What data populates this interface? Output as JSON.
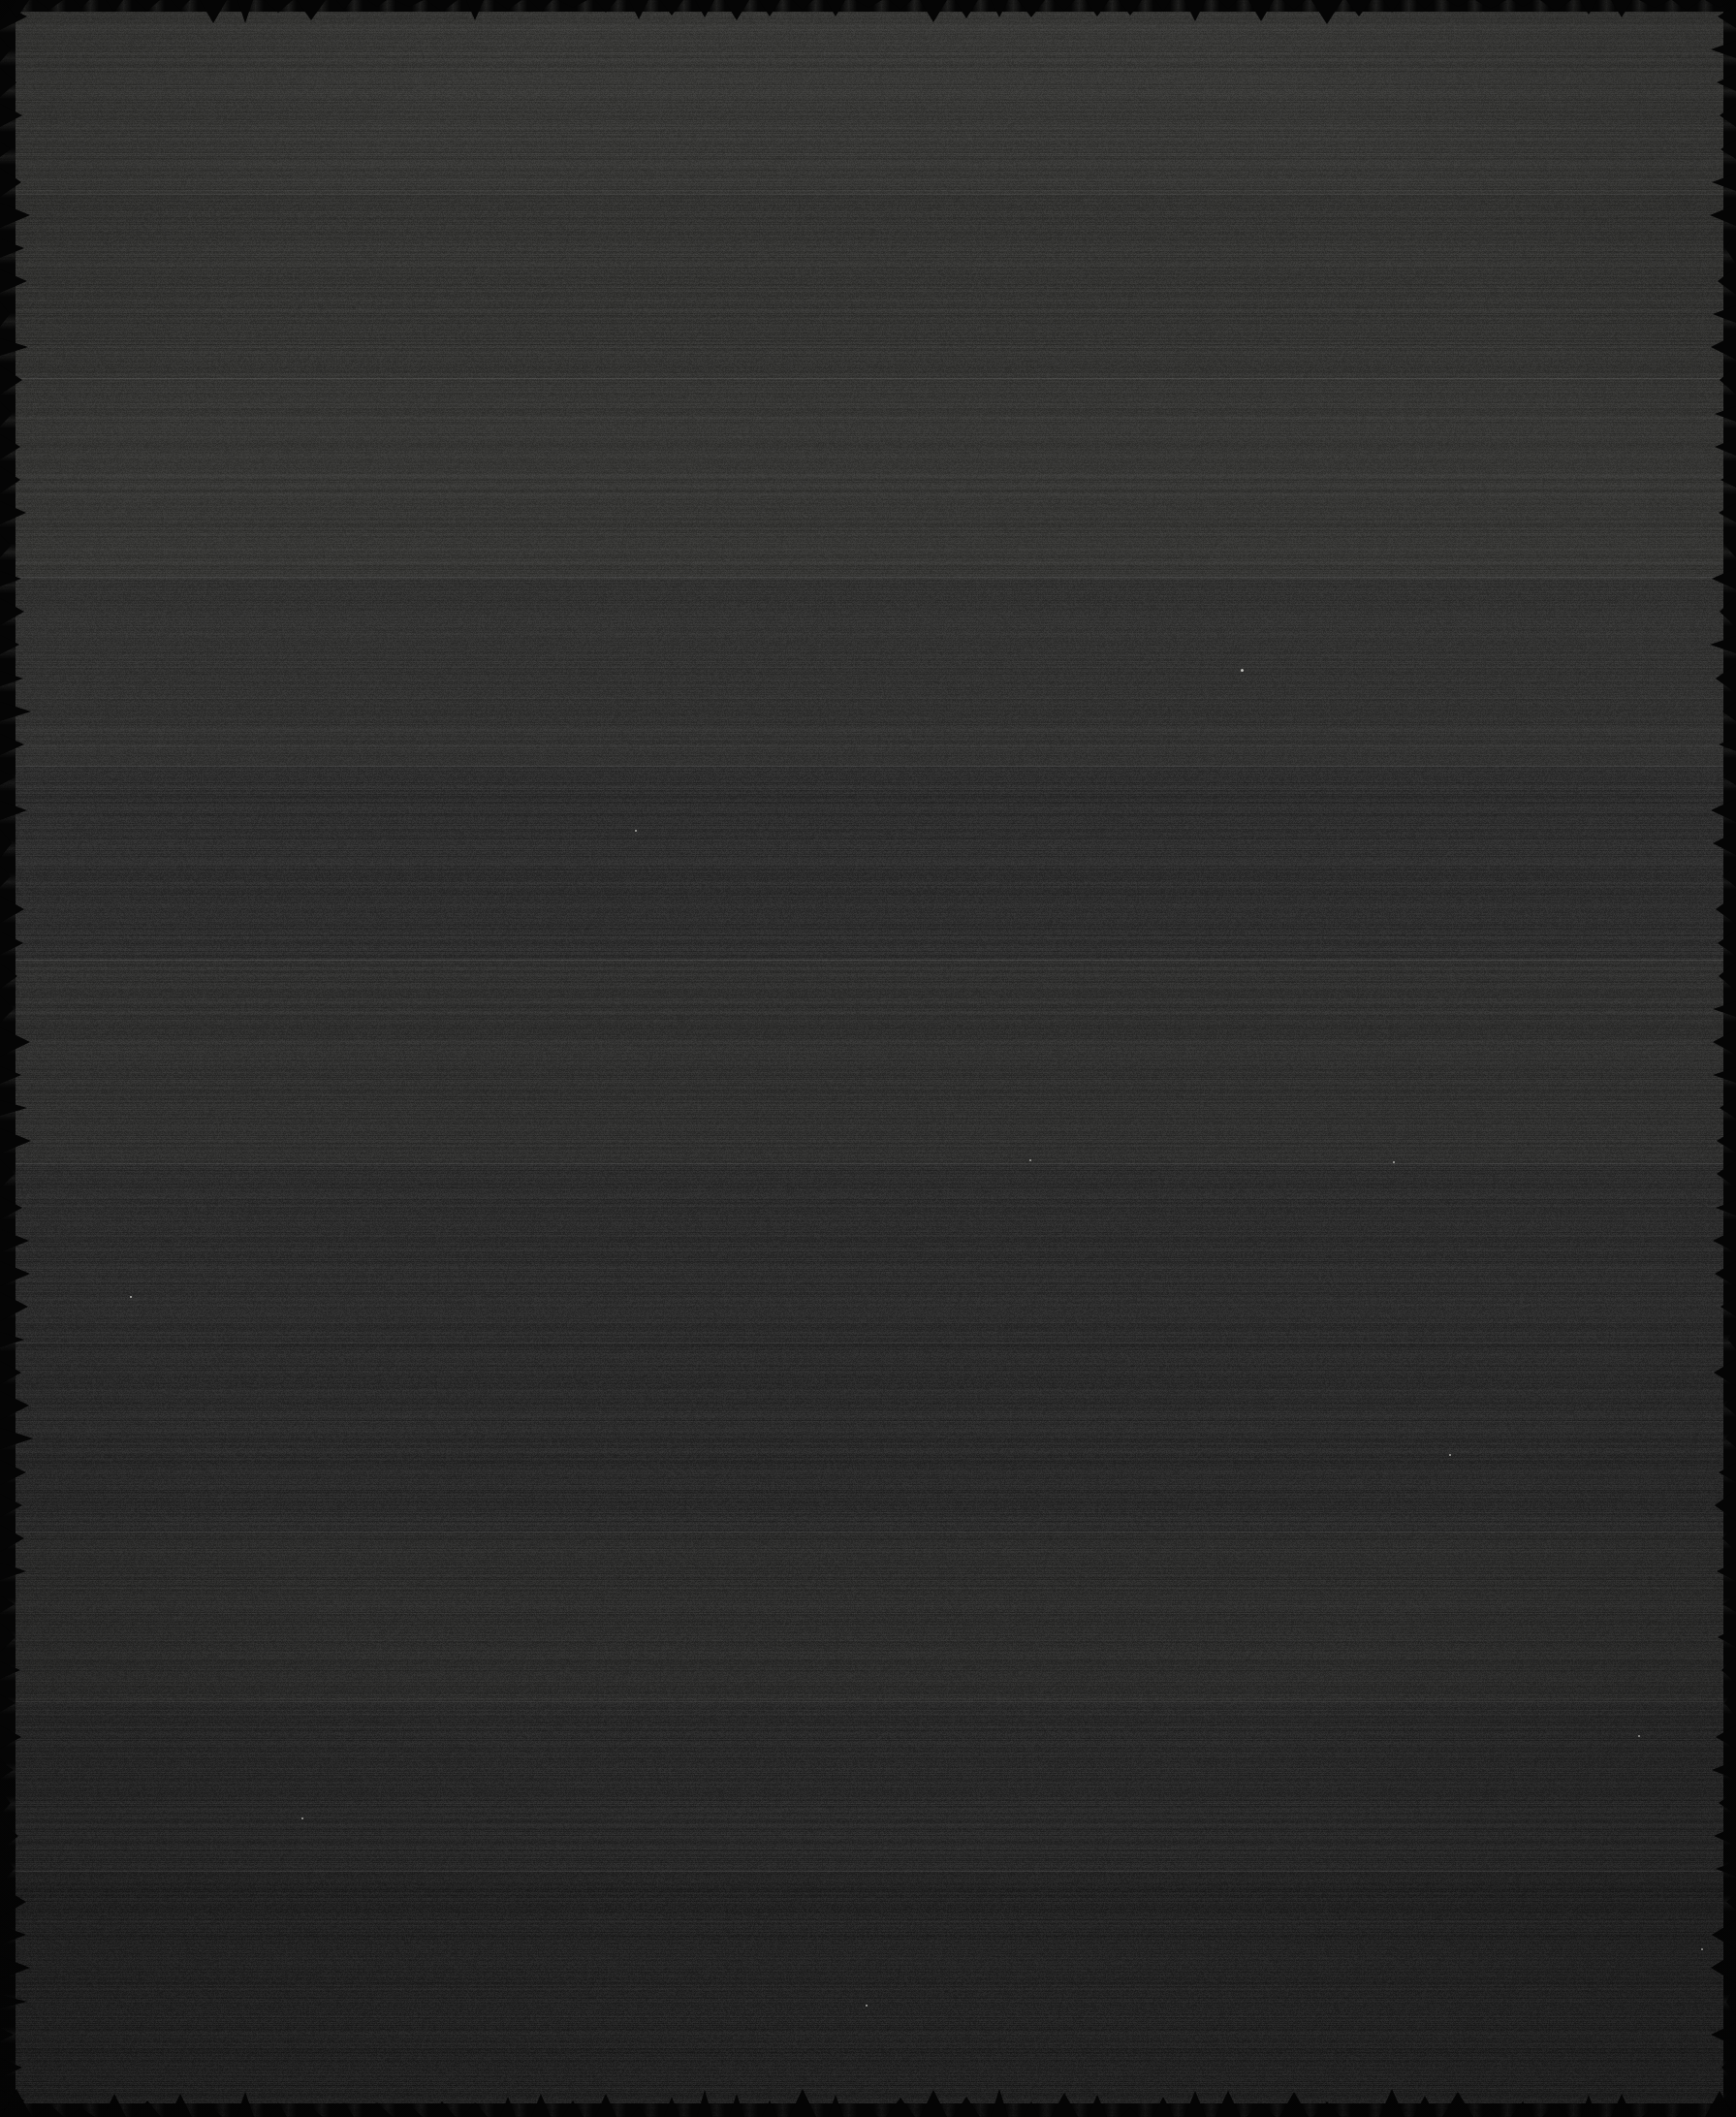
{
  "image": {
    "title": "Dark Noise Surface",
    "description": "Near-black, heavily noise-corrupted surface with horizontal luminance banding and scalloped dark edge fringes. No UI chrome, text, icons or widgets are present.",
    "width": 1791,
    "height": 2184,
    "content_kind": "no-readable-content",
    "visible_text": "",
    "overall_appearance": "underexposed monochrome field",
    "palette": {
      "background": "#262626",
      "lightest_band": "#32322f",
      "darkest_band": "#1b1b1b",
      "top_tone": "#2e2e2c",
      "bottom_tone": "#1d1d1d",
      "edge_fringe": "#050505",
      "speck_highlight": "#c8c8c4"
    },
    "gradient": {
      "direction": "vertical",
      "from": "#2f2f2d",
      "to": "#1b1b1b"
    },
    "noise": {
      "type": "monochrome-grain",
      "character": "horizontal-streak scanline",
      "amplitude": 26,
      "streak_bias": 0.62
    },
    "bands": [
      {
        "index": 0,
        "y_start": 0,
        "y_end": 200,
        "height": 200,
        "tone": "#2f2f2d",
        "label": "band-1"
      },
      {
        "index": 1,
        "y_start": 200,
        "y_end": 390,
        "height": 190,
        "tone": "#2b2b29",
        "label": "band-2"
      },
      {
        "index": 2,
        "y_start": 390,
        "y_end": 595,
        "height": 205,
        "tone": "#2e2e2c",
        "label": "band-3"
      },
      {
        "index": 3,
        "y_start": 595,
        "y_end": 790,
        "height": 195,
        "tone": "#292928",
        "label": "band-4"
      },
      {
        "index": 4,
        "y_start": 790,
        "y_end": 990,
        "height": 200,
        "tone": "#242424",
        "label": "band-5"
      },
      {
        "index": 5,
        "y_start": 990,
        "y_end": 1200,
        "height": 210,
        "tone": "#272726",
        "label": "band-6"
      },
      {
        "index": 6,
        "y_start": 1200,
        "y_end": 1385,
        "height": 185,
        "tone": "#232323",
        "label": "band-7"
      },
      {
        "index": 7,
        "y_start": 1385,
        "y_end": 1580,
        "height": 195,
        "tone": "#202020",
        "label": "band-8"
      },
      {
        "index": 8,
        "y_start": 1580,
        "y_end": 1755,
        "height": 175,
        "tone": "#232322",
        "label": "band-9"
      },
      {
        "index": 9,
        "y_start": 1755,
        "y_end": 1930,
        "height": 175,
        "tone": "#1f1f1f",
        "label": "band-10"
      },
      {
        "index": 10,
        "y_start": 1930,
        "y_end": 2184,
        "height": 254,
        "tone": "#1a1a1a",
        "label": "band-11"
      }
    ],
    "seam_positions": [
      200,
      390,
      595,
      790,
      990,
      1200,
      1385,
      1580,
      1755,
      1930
    ],
    "edge_fringe": {
      "color": "#050505",
      "shape": "scalloped",
      "top_thickness": 12,
      "bottom_thickness": 14,
      "left_thickness": 16,
      "right_thickness": 13,
      "tooth_width": 34
    },
    "specks": [
      {
        "x": 1280,
        "y": 690,
        "size": 3,
        "color": "#c8c8c4"
      },
      {
        "x": 655,
        "y": 856,
        "size": 2,
        "color": "#b4b4b0"
      },
      {
        "x": 134,
        "y": 1337,
        "size": 2,
        "color": "#bebeba"
      },
      {
        "x": 1437,
        "y": 1198,
        "size": 2,
        "color": "#b0b0ac"
      },
      {
        "x": 1062,
        "y": 1196,
        "size": 2,
        "color": "#aaaaa6"
      },
      {
        "x": 893,
        "y": 2068,
        "size": 2,
        "color": "#bcbcb8"
      },
      {
        "x": 1755,
        "y": 2010,
        "size": 2,
        "color": "#b2b2ae"
      },
      {
        "x": 1690,
        "y": 1790,
        "size": 2,
        "color": "#a8a8a4"
      },
      {
        "x": 311,
        "y": 1875,
        "size": 2,
        "color": "#b6b6b2"
      },
      {
        "x": 1495,
        "y": 1500,
        "size": 2,
        "color": "#aeaeaa"
      }
    ]
  }
}
